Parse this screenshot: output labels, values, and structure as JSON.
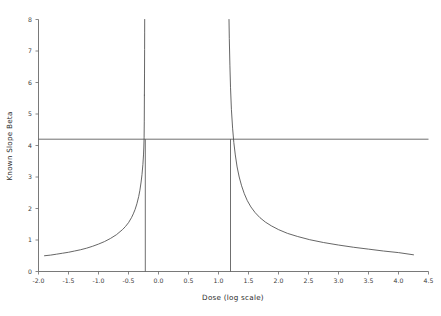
{
  "chart_data": {
    "type": "line",
    "title": "",
    "xlabel": "Dose (log scale)",
    "ylabel": "Known Slope Beta",
    "xlim": [
      -2.0,
      4.5
    ],
    "ylim": [
      0,
      8
    ],
    "grid": false,
    "legend": null,
    "xticks": [
      -2.0,
      -1.5,
      -1.0,
      -0.5,
      0.0,
      0.5,
      1.0,
      1.5,
      2.0,
      2.5,
      3.0,
      3.5,
      4.0,
      4.5
    ],
    "xtick_labels": [
      "-2.0",
      "-1.5",
      "-1.0",
      "-0.5",
      "0.0",
      "0.5",
      "1.0",
      "1.5",
      "2.0",
      "2.5",
      "3.0",
      "3.5",
      "4.0",
      "4.5"
    ],
    "yticks": [
      0,
      1,
      2,
      3,
      4,
      5,
      6,
      7,
      8
    ],
    "ytick_labels": [
      "0",
      "1",
      "2",
      "3",
      "4",
      "5",
      "6",
      "7",
      "8"
    ],
    "annotations": {
      "horizontal_reference_value": 4.2,
      "vertical_reference_values": [
        -0.22,
        1.2
      ]
    },
    "series": [
      {
        "name": "left-branch",
        "x": [
          -1.9,
          -1.8,
          -1.7,
          -1.6,
          -1.5,
          -1.4,
          -1.3,
          -1.2,
          -1.1,
          -1.0,
          -0.9,
          -0.8,
          -0.7,
          -0.6,
          -0.55,
          -0.5,
          -0.45,
          -0.42,
          -0.39,
          -0.36,
          -0.33,
          -0.31,
          -0.29,
          -0.275,
          -0.26,
          -0.25,
          -0.245,
          -0.24,
          -0.237,
          -0.235
        ],
        "y": [
          0.5,
          0.52,
          0.55,
          0.58,
          0.61,
          0.65,
          0.69,
          0.74,
          0.8,
          0.87,
          0.95,
          1.05,
          1.17,
          1.33,
          1.43,
          1.55,
          1.71,
          1.83,
          1.97,
          2.15,
          2.38,
          2.58,
          2.84,
          3.08,
          3.4,
          3.7,
          3.92,
          4.25,
          4.75,
          5.6
        ]
      },
      {
        "name": "left-branch-upper",
        "x": [
          -0.235,
          -0.233,
          -0.2315,
          -0.2305,
          -0.23
        ],
        "y": [
          5.6,
          6.3,
          7.05,
          7.6,
          8.0
        ]
      },
      {
        "name": "right-branch",
        "x": [
          1.175,
          1.18,
          1.19,
          1.2,
          1.215,
          1.235,
          1.255,
          1.28,
          1.31,
          1.345,
          1.385,
          1.43,
          1.48,
          1.54,
          1.61,
          1.69,
          1.78,
          1.88,
          2.0,
          2.15,
          2.32,
          2.52,
          2.75,
          3.0,
          3.25,
          3.5,
          3.75,
          4.0,
          4.25
        ],
        "y": [
          8.0,
          7.4,
          6.55,
          5.85,
          5.15,
          4.55,
          4.1,
          3.7,
          3.32,
          3.0,
          2.72,
          2.47,
          2.25,
          2.05,
          1.87,
          1.71,
          1.57,
          1.45,
          1.33,
          1.21,
          1.11,
          1.01,
          0.92,
          0.84,
          0.77,
          0.71,
          0.65,
          0.6,
          0.53
        ]
      }
    ]
  }
}
